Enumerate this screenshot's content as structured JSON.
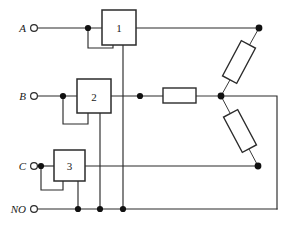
{
  "diagram": {
    "canvas": {
      "width": 291,
      "height": 225,
      "background": "#ffffff"
    },
    "line_color": "#2b2b2b",
    "node_color": "#111111"
  },
  "terminals": [
    {
      "id": "A",
      "label": "A",
      "label_x": 26,
      "label_y": 28,
      "ring_x": 34,
      "ring_y": 28,
      "ring_r": 3.4
    },
    {
      "id": "B",
      "label": "B",
      "label_x": 26,
      "label_y": 96,
      "ring_x": 34,
      "ring_y": 96,
      "ring_r": 3.4
    },
    {
      "id": "C",
      "label": "C",
      "label_x": 26,
      "label_y": 166,
      "ring_x": 34,
      "ring_y": 166,
      "ring_r": 3.4
    },
    {
      "id": "NO",
      "label": "NO",
      "label_x": 26,
      "label_y": 209,
      "ring_x": 34,
      "ring_y": 209,
      "ring_r": 3.4
    }
  ],
  "boxes": [
    {
      "id": "box-1",
      "label": "1",
      "x": 102,
      "y": 10,
      "width": 34,
      "height": 35
    },
    {
      "id": "box-2",
      "label": "2",
      "x": 77,
      "y": 79,
      "width": 34,
      "height": 34
    },
    {
      "id": "box-3",
      "label": "3",
      "x": 54,
      "y": 150,
      "width": 31,
      "height": 31
    }
  ],
  "resistors": [
    {
      "id": "resistor-horizontal",
      "x": 163,
      "y": 88,
      "width": 33,
      "height": 15,
      "rotation": 0,
      "cx": 179.5,
      "cy": 95.5
    },
    {
      "id": "resistor-upper-diagonal",
      "cx": 239,
      "cy": 62,
      "width": 16,
      "height": 40,
      "rotation": 28
    },
    {
      "id": "resistor-lower-diagonal",
      "cx": 240,
      "cy": 131,
      "width": 16,
      "height": 40,
      "rotation": -28
    }
  ],
  "junction_dots": [
    {
      "id": "dot-a-tap",
      "x": 88,
      "y": 28,
      "r": 3.1
    },
    {
      "id": "dot-b-tap",
      "x": 63,
      "y": 96,
      "r": 3.1
    },
    {
      "id": "dot-b-mid",
      "x": 140,
      "y": 96,
      "r": 3.1
    },
    {
      "id": "dot-c-tap",
      "x": 41,
      "y": 166,
      "r": 3.1
    },
    {
      "id": "dot-star-center",
      "x": 221,
      "y": 96,
      "r": 3.4
    },
    {
      "id": "dot-top-right",
      "x": 259,
      "y": 28,
      "r": 3.4
    },
    {
      "id": "dot-bottom-right",
      "x": 258,
      "y": 166,
      "r": 3.4
    },
    {
      "id": "dot-no-box3",
      "x": 78,
      "y": 209,
      "r": 3.1
    },
    {
      "id": "dot-no-box2",
      "x": 100,
      "y": 209,
      "r": 3.1
    },
    {
      "id": "dot-no-box1",
      "x": 123,
      "y": 209,
      "r": 3.1
    }
  ],
  "wires": [
    {
      "id": "wire-a-input",
      "points": "38,28 102,28"
    },
    {
      "id": "wire-a-output",
      "points": "136,28 259,28"
    },
    {
      "id": "wire-a-feedback",
      "points": "88,28 88,48 113,48 113,45"
    },
    {
      "id": "wire-box1-neutral",
      "points": "123,45 123,209"
    },
    {
      "id": "wire-b-input",
      "points": "38,96 77,96"
    },
    {
      "id": "wire-b-output",
      "points": "111,96 163,96"
    },
    {
      "id": "wire-b-feedback",
      "points": "63,96 63,124 88,124 88,113"
    },
    {
      "id": "wire-box2-neutral",
      "points": "100,113 100,209"
    },
    {
      "id": "wire-resistor-to-star",
      "points": "196,96 221,96"
    },
    {
      "id": "wire-c-input",
      "points": "38,166 54,166"
    },
    {
      "id": "wire-c-output",
      "points": "85,166 258,166"
    },
    {
      "id": "wire-c-feedback",
      "points": "41,166 41,190 63,190 63,181"
    },
    {
      "id": "wire-box3-neutral",
      "points": "78,181 78,209"
    },
    {
      "id": "wire-no-bus",
      "points": "38,209 277,209"
    },
    {
      "id": "wire-right-riser",
      "points": "277,209 277,96 221,96"
    },
    {
      "id": "wire-star-upper-leg",
      "points": "259,28 221,96"
    },
    {
      "id": "wire-star-lower-leg",
      "points": "221,96 258,166"
    }
  ]
}
